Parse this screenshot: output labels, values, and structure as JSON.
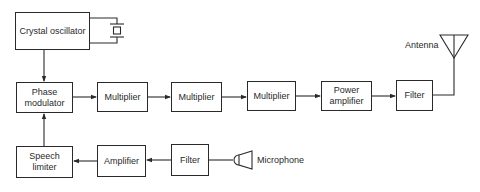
{
  "diagram": {
    "type": "block-diagram",
    "blocks": {
      "crystal_oscillator": "Crystal oscillator",
      "phase_modulator_line1": "Phase",
      "phase_modulator_line2": "modulator",
      "multiplier_1": "Multiplier",
      "multiplier_2": "Multiplier",
      "multiplier_3": "Multiplier",
      "power_amplifier_line1": "Power",
      "power_amplifier_line2": "amplifier",
      "filter_output": "Filter",
      "speech_limiter_line1": "Speech",
      "speech_limiter_line2": "limiter",
      "amplifier": "Amplifier",
      "filter_input": "Filter"
    },
    "labels": {
      "antenna": "Antenna",
      "microphone": "Microphone"
    },
    "connections": [
      {
        "from": "Crystal oscillator",
        "to": "Phase modulator"
      },
      {
        "from": "Phase modulator",
        "to": "Multiplier"
      },
      {
        "from": "Multiplier",
        "to": "Multiplier"
      },
      {
        "from": "Multiplier",
        "to": "Multiplier"
      },
      {
        "from": "Multiplier",
        "to": "Power amplifier"
      },
      {
        "from": "Power amplifier",
        "to": "Filter"
      },
      {
        "from": "Filter",
        "to": "Antenna"
      },
      {
        "from": "Microphone",
        "to": "Filter"
      },
      {
        "from": "Filter",
        "to": "Amplifier"
      },
      {
        "from": "Amplifier",
        "to": "Speech limiter"
      },
      {
        "from": "Speech limiter",
        "to": "Phase modulator"
      }
    ],
    "colors": {
      "line": "#2a2a2a",
      "background": "#ffffff"
    }
  }
}
